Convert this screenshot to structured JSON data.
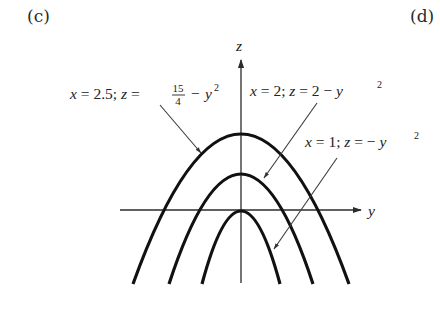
{
  "panels": {
    "left_tag": "(c)",
    "right_tag": "(d)"
  },
  "axes": {
    "vertical_label": "z",
    "horizontal_label": "y"
  },
  "curves": [
    {
      "id": "outer",
      "x_value": "2.5",
      "equation_lhs": "z",
      "constant_numerator": "15",
      "constant_denominator": "4",
      "equation_rhs_tail": "y",
      "exponent": "2",
      "label_x_part": "x = 2.5;",
      "label_z_part": "z =",
      "label_minus": "−"
    },
    {
      "id": "middle",
      "x_value": "2",
      "label_x_part": "x = 2;",
      "label_z_part": "z = 2 −",
      "equation_rhs_tail": "y",
      "exponent": "2"
    },
    {
      "id": "inner",
      "x_value": "1",
      "label_x_part": "x = 1;",
      "label_z_part": "z = −",
      "equation_rhs_tail": "y",
      "exponent": "2"
    }
  ],
  "colors": {
    "curve": "#111111",
    "axis": "#2b2b2b",
    "background": "#ffffff"
  }
}
